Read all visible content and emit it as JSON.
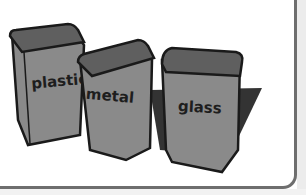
{
  "illustration": {
    "description": "Three recycling bins",
    "bins": [
      {
        "label": "plastic"
      },
      {
        "label": "metal"
      },
      {
        "label": "glass"
      }
    ]
  },
  "colors": {
    "bin_fill": "#8a8a8a",
    "bin_inner": "#5f5f5f",
    "outline": "#1a1a1a",
    "shadow": "#333333",
    "frame": "#6e6e6e"
  }
}
